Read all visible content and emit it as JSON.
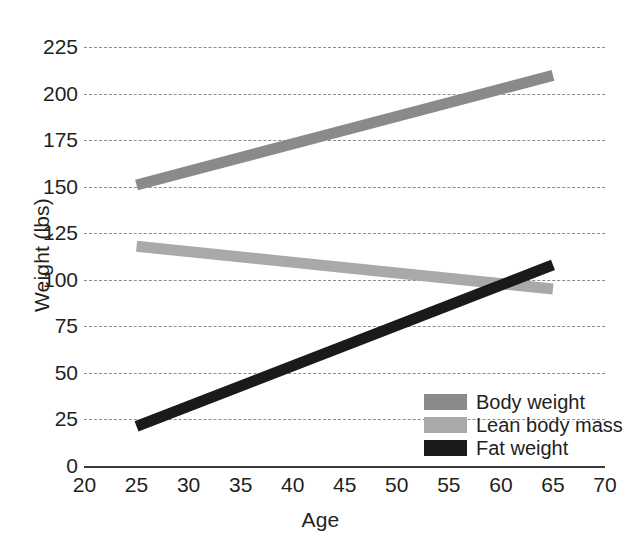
{
  "chart_data": {
    "type": "line",
    "title": "",
    "xlabel": "Age",
    "ylabel": "Weight (lbs)",
    "xlim": [
      20,
      70
    ],
    "ylim": [
      0,
      225
    ],
    "xticks": [
      20,
      25,
      30,
      35,
      40,
      45,
      50,
      55,
      60,
      65,
      70
    ],
    "yticks": [
      0,
      25,
      50,
      75,
      100,
      125,
      150,
      175,
      200,
      225
    ],
    "grid": "horizontal-dashed",
    "legend_position": "lower-right-inside",
    "x": [
      25,
      65
    ],
    "series": [
      {
        "name": "Body weight",
        "color": "#8a8a8a",
        "values": [
          151,
          210
        ]
      },
      {
        "name": "Lean body mass",
        "color": "#a9a9a9",
        "values": [
          118,
          95
        ]
      },
      {
        "name": "Fat weight",
        "color": "#1a1a1a",
        "values": [
          21,
          108
        ]
      }
    ]
  },
  "axes": {
    "x_title": "Age",
    "y_title": "Weight (lbs)",
    "x_tick_labels": [
      "20",
      "25",
      "30",
      "35",
      "40",
      "45",
      "50",
      "55",
      "60",
      "65",
      "70"
    ],
    "y_tick_labels": [
      "0",
      "25",
      "50",
      "75",
      "100",
      "125",
      "150",
      "175",
      "200",
      "225"
    ]
  },
  "legend": {
    "items": [
      {
        "label": "Body weight",
        "color": "#8a8a8a"
      },
      {
        "label": "Lean body mass",
        "color": "#a9a9a9"
      },
      {
        "label": "Fat weight",
        "color": "#1a1a1a"
      }
    ]
  },
  "colors": {
    "background": "#ffffff",
    "text": "#231f20",
    "grid": "#8c8c8c",
    "axis": "#3a3a3a"
  }
}
